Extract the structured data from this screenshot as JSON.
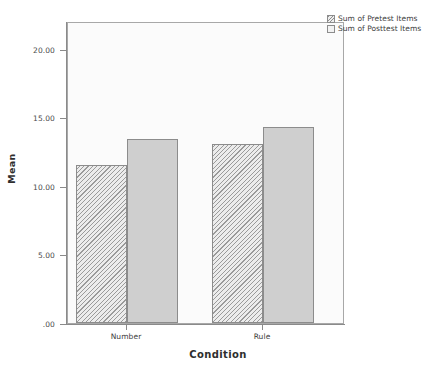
{
  "chart_data": {
    "type": "bar",
    "title": "",
    "xlabel": "Condition",
    "ylabel": "Mean",
    "categories": [
      "Number",
      "Rule"
    ],
    "series": [
      {
        "name": "Sum of Pretest Items",
        "values": [
          11.6,
          13.1
        ],
        "pattern": "diagonal-hatch",
        "color": "#d8d8d8"
      },
      {
        "name": "Sum of Posttest Items",
        "values": [
          13.5,
          14.4
        ],
        "pattern": "solid",
        "color": "#cfcfcf"
      }
    ],
    "ylim": [
      0,
      22
    ],
    "yticks": [
      0,
      5,
      10,
      15,
      20
    ],
    "ytick_labels": [
      ".00",
      "5.00",
      "10.00",
      "15.00",
      "20.00"
    ],
    "grid": false,
    "legend_position": "top-right",
    "plot_background": "#fbfbfb",
    "frame_color": "#a8a8a8"
  },
  "axes": {
    "y_title": "Mean",
    "x_title": "Condition",
    "y_labels": [
      ".00",
      "5.00",
      "10.00",
      "15.00",
      "20.00"
    ],
    "x_labels": [
      "Number",
      "Rule"
    ]
  },
  "legend": {
    "items": [
      {
        "label": "Sum of Pretest Items"
      },
      {
        "label": "Sum of Posttest Items"
      }
    ]
  }
}
